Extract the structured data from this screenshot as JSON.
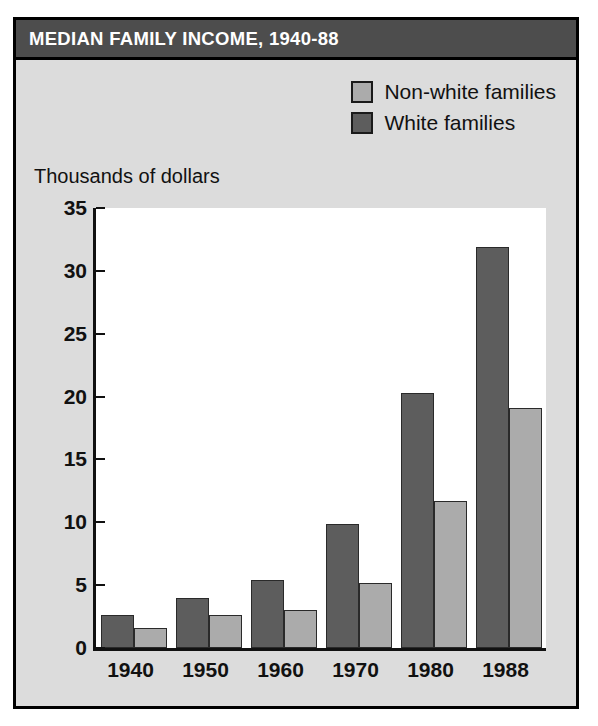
{
  "figure": {
    "title": "MEDIAN FAMILY INCOME, 1940-88",
    "axis_caption": "Thousands of dollars"
  },
  "legend": {
    "items": [
      {
        "label": "Non-white families",
        "color": "#ababab",
        "series_key": "non_white"
      },
      {
        "label": "White families",
        "color": "#5d5d5d",
        "series_key": "white"
      }
    ]
  },
  "colors": {
    "panel_background": "#dcdcdc",
    "title_bar": "#4d4d4d",
    "title_text": "#ffffff",
    "plot_background": "#ffffff",
    "frame": "#000000",
    "white_families_bar": "#5d5d5d",
    "non_white_families_bar": "#ababab"
  },
  "chart_data": {
    "type": "bar",
    "title": "MEDIAN FAMILY INCOME, 1940-88",
    "xlabel": "",
    "ylabel": "Thousands of dollars",
    "categories": [
      "1940",
      "1950",
      "1960",
      "1970",
      "1980",
      "1988"
    ],
    "yticks": [
      0,
      5,
      10,
      15,
      20,
      25,
      30,
      35
    ],
    "ytick_labels": [
      "0",
      "5",
      "10",
      "15",
      "20",
      "25",
      "30",
      "35"
    ],
    "ylim": [
      0,
      35
    ],
    "grid": false,
    "legend_position": "top-right",
    "series": [
      {
        "name": "White families",
        "key": "white",
        "color": "#5d5d5d",
        "values": [
          2.6,
          4.0,
          5.4,
          9.9,
          20.3,
          31.9
        ]
      },
      {
        "name": "Non-white families",
        "key": "non_white",
        "color": "#ababab",
        "values": [
          1.6,
          2.65,
          3.05,
          5.2,
          11.7,
          19.1
        ]
      }
    ]
  }
}
